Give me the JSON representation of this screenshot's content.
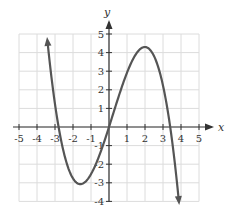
{
  "chart_data": {
    "type": "line",
    "title": "",
    "xlabel": "x",
    "ylabel": "y",
    "xlim": [
      -5,
      5
    ],
    "ylim": [
      -4,
      5
    ],
    "grid": true,
    "x_ticks": [
      -5,
      -4,
      -3,
      -2,
      -1,
      1,
      2,
      3,
      4,
      5
    ],
    "y_ticks": [
      -4,
      -3,
      -2,
      -1,
      1,
      2,
      3,
      4,
      5
    ],
    "series": [
      {
        "name": "cubic",
        "description": "Cubic polynomial with x-intercepts near -2.8, 0 and 3.4; local minimum near (-1.5, -2.8); local maximum near (2, 4.3); arrows at both ends (up-left, down-right)",
        "x_intercepts": [
          -2.8,
          0,
          3.4
        ],
        "local_min": [
          -1.5,
          -2.8
        ],
        "local_max": [
          2,
          4.3
        ],
        "end_behavior": {
          "left": "up",
          "right": "down"
        },
        "coefficient": -0.32
      }
    ],
    "colors": {
      "curve": "#555555",
      "grid": "#dcdcdc",
      "axis": "#333333"
    }
  }
}
